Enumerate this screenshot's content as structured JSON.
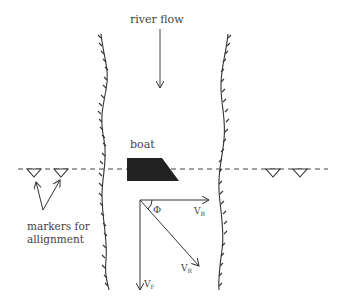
{
  "diagram": {
    "title_label": "river flow",
    "boat_label": "boat",
    "markers_label_line1": "markers for",
    "markers_label_line2": "allignment",
    "angle_label": "Φ",
    "vectors": {
      "boat_velocity": {
        "symbol": "V",
        "subscript": "B"
      },
      "resultant_velocity": {
        "symbol": "V",
        "subscript": "R"
      },
      "flow_velocity": {
        "symbol": "V",
        "subscript": "F"
      }
    },
    "colors": {
      "ink": "#333333",
      "boat_fill": "#222222",
      "text": "#444444"
    }
  }
}
